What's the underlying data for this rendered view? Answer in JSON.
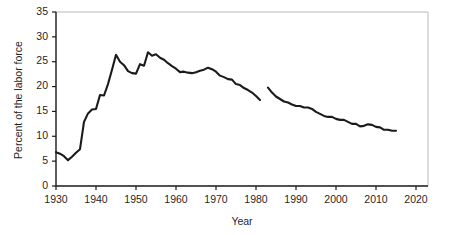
{
  "chart_data": {
    "type": "line",
    "title": "",
    "xlabel": "Year",
    "ylabel": "Percent of the labor force",
    "xlim": [
      1930,
      2023
    ],
    "ylim": [
      0,
      35
    ],
    "grid": false,
    "legend": null,
    "x_ticks": [
      1930,
      1940,
      1950,
      1960,
      1970,
      1980,
      1990,
      2000,
      2010,
      2020
    ],
    "x_tick_labels": [
      "1930",
      "1940",
      "1950",
      "1960",
      "1970",
      "1980",
      "1990",
      "2000",
      "2010",
      "2020"
    ],
    "y_ticks": [
      0,
      5,
      10,
      15,
      20,
      25,
      30,
      35
    ],
    "y_tick_labels": [
      "0",
      "5",
      "10",
      "15",
      "20",
      "25",
      "30",
      "35"
    ],
    "line_color": "#1a1a1a",
    "series": [
      {
        "name": "segment-1930-1981",
        "x": [
          1930,
          1931,
          1932,
          1933,
          1934,
          1935,
          1936,
          1937,
          1938,
          1939,
          1940,
          1941,
          1942,
          1943,
          1944,
          1945,
          1946,
          1947,
          1948,
          1949,
          1950,
          1951,
          1952,
          1953,
          1954,
          1955,
          1956,
          1957,
          1958,
          1959,
          1960,
          1961,
          1962,
          1963,
          1964,
          1965,
          1966,
          1967,
          1968,
          1969,
          1970,
          1971,
          1972,
          1973,
          1974,
          1975,
          1976,
          1977,
          1978,
          1979,
          1980,
          1981
        ],
        "values": [
          6.8,
          6.5,
          6.0,
          5.2,
          5.9,
          6.7,
          7.4,
          12.9,
          14.6,
          15.4,
          15.5,
          18.3,
          18.2,
          20.5,
          23.4,
          26.4,
          25.0,
          24.3,
          23.1,
          22.7,
          22.6,
          24.5,
          24.2,
          26.9,
          26.2,
          26.5,
          25.8,
          25.4,
          24.7,
          24.1,
          23.6,
          22.9,
          23.0,
          22.8,
          22.7,
          22.9,
          23.2,
          23.4,
          23.8,
          23.5,
          23.0,
          22.2,
          21.9,
          21.5,
          21.4,
          20.5,
          20.3,
          19.7,
          19.3,
          18.8,
          18.1,
          17.3
        ]
      },
      {
        "name": "segment-1983-2015",
        "x": [
          1983,
          1984,
          1985,
          1986,
          1987,
          1988,
          1989,
          1990,
          1991,
          1992,
          1993,
          1994,
          1995,
          1996,
          1997,
          1998,
          1999,
          2000,
          2001,
          2002,
          2003,
          2004,
          2005,
          2006,
          2007,
          2008,
          2009,
          2010,
          2011,
          2012,
          2013,
          2014,
          2015
        ],
        "values": [
          19.8,
          18.8,
          18.0,
          17.5,
          17.0,
          16.8,
          16.4,
          16.1,
          16.1,
          15.8,
          15.8,
          15.5,
          14.9,
          14.5,
          14.1,
          13.9,
          13.9,
          13.5,
          13.3,
          13.3,
          12.9,
          12.5,
          12.5,
          12.0,
          12.1,
          12.4,
          12.3,
          11.9,
          11.8,
          11.3,
          11.3,
          11.1,
          11.1
        ]
      }
    ]
  }
}
